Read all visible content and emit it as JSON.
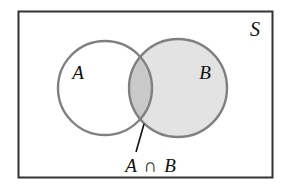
{
  "figure": {
    "name": "venn-diagram-intersection",
    "type": "venn-two-set"
  },
  "universe": {
    "label": "S",
    "border_color": "#333333",
    "fill_color": "#ffffff"
  },
  "sets": [
    {
      "id": "A",
      "label": "A",
      "fill_color": "#ffffff",
      "stroke_color": "#808080",
      "cx": 105,
      "cy": 88,
      "r": 47,
      "label_x": 78,
      "label_y": 79
    },
    {
      "id": "B",
      "label": "B",
      "fill_color": "#e3e3e3",
      "stroke_color": "#808080",
      "cx": 178,
      "cy": 88,
      "r": 49,
      "label_x": 205,
      "label_y": 79
    }
  ],
  "intersection": {
    "label_set_a": "A",
    "operator": "∩",
    "label_set_b": "B",
    "full_label": "A ∩ B",
    "fill_color": "#c9c9c9",
    "shaded": true,
    "label_x": 150,
    "label_y": 168
  },
  "leader_line": {
    "name": "intersection-leader-line",
    "color": "#111111",
    "x1": 144,
    "y1": 124,
    "x2": 136,
    "y2": 152
  },
  "colors": {
    "page_background": "#ffffff",
    "universe_border": "#333333",
    "circle_stroke": "#808080",
    "set_b_fill": "#e3e3e3",
    "intersection_fill": "#c9c9c9",
    "text": "#111111"
  }
}
